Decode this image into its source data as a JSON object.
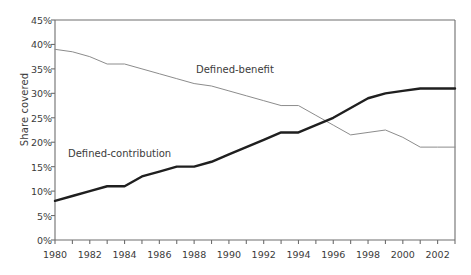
{
  "chart_data": {
    "type": "line",
    "title": "",
    "xlabel": "",
    "ylabel": "Share covered",
    "xlim": [
      1980,
      2003
    ],
    "ylim": [
      0,
      45
    ],
    "grid": false,
    "legend_position": "inline-annotation",
    "x": [
      1980,
      1981,
      1982,
      1983,
      1984,
      1985,
      1986,
      1987,
      1988,
      1989,
      1990,
      1991,
      1992,
      1993,
      1994,
      1995,
      1996,
      1997,
      1998,
      1999,
      2000,
      2001,
      2002,
      2003
    ],
    "y_ticks": [
      0,
      5,
      10,
      15,
      20,
      25,
      30,
      35,
      40,
      45
    ],
    "y_tick_labels": [
      "0%",
      "5%",
      "10%",
      "15%",
      "20%",
      "25%",
      "30%",
      "35%",
      "40%",
      "45%"
    ],
    "x_tick_labels": [
      "1980",
      "1981",
      "1982",
      "1983",
      "1984",
      "1985",
      "1986",
      "1987",
      "1988",
      "1989",
      "1990",
      "1991",
      "1992",
      "1993",
      "1994",
      "1995",
      "1996",
      "1997",
      "1998",
      "1999",
      "2000",
      "2001",
      "2002",
      "2003"
    ],
    "x_labeled_ticks": [
      "1980",
      "1982",
      "1984",
      "1986",
      "1988",
      "1990",
      "1992",
      "1994",
      "1996",
      "1998",
      "2000",
      "2002"
    ],
    "series": [
      {
        "name": "Defined-benefit",
        "color": "#8c8c8c",
        "width": 1,
        "annotation": "Defined-benefit",
        "values": [
          39,
          38.5,
          37.5,
          36,
          36,
          35,
          34,
          33,
          32,
          31.5,
          30.5,
          29.5,
          28.5,
          27.5,
          27.5,
          25.5,
          23.5,
          21.5,
          22,
          22.5,
          21,
          19,
          19,
          19
        ]
      },
      {
        "name": "Defined-contribution",
        "color": "#1f1f1f",
        "width": 2.4,
        "annotation": "Defined-contribution",
        "values": [
          8,
          9,
          10,
          11,
          11,
          13,
          14,
          15,
          15,
          16,
          17.5,
          19,
          20.5,
          22,
          22,
          23.5,
          25,
          27,
          29,
          30,
          30.5,
          31,
          31,
          31
        ]
      }
    ]
  },
  "axis": {
    "y_title": "Share covered"
  },
  "annotations": {
    "defined_benefit": "Defined-benefit",
    "defined_contribution": "Defined-contribution"
  },
  "colors": {
    "defined_benefit": "#8c8c8c",
    "defined_contribution": "#1f1f1f",
    "axis": "#6e6e6e",
    "text": "#3b3b3b",
    "background": "#ffffff"
  }
}
